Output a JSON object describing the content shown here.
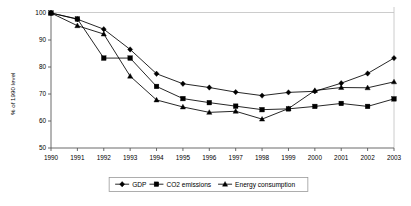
{
  "chart_data": {
    "type": "line",
    "title": "",
    "xlabel": "",
    "ylabel": "% of 1990 level",
    "categories": [
      "1990",
      "1991",
      "1992",
      "1993",
      "1994",
      "1995",
      "1996",
      "1997",
      "1998",
      "1999",
      "2000",
      "2001",
      "2002",
      "2003"
    ],
    "x": [
      1990,
      1991,
      1992,
      1993,
      1994,
      1995,
      1996,
      1997,
      1998,
      1999,
      2000,
      2001,
      2002,
      2003
    ],
    "ylim": [
      50,
      100
    ],
    "xlim": [
      1990,
      2003
    ],
    "yticks": [
      50,
      60,
      70,
      80,
      90,
      100
    ],
    "ytick_labels": [
      "50",
      "60",
      "70",
      "80",
      "90",
      "100"
    ],
    "grid": false,
    "legend_position": "bottom",
    "series": [
      {
        "name": "GDP",
        "marker": "diamond",
        "color": "#000000",
        "values": [
          100.0,
          97.7,
          94.0,
          86.5,
          77.5,
          73.8,
          72.4,
          70.7,
          69.4,
          70.6,
          71.0,
          74.0,
          77.6,
          83.3
        ]
      },
      {
        "name": "CO2 emissions",
        "marker": "square",
        "color": "#000000",
        "values": [
          100.0,
          97.8,
          83.3,
          83.3,
          72.8,
          68.3,
          66.8,
          65.5,
          64.2,
          64.5,
          65.4,
          66.5,
          65.4,
          68.2
        ]
      },
      {
        "name": "Energy consumption",
        "marker": "triangle",
        "color": "#000000",
        "values": [
          100.0,
          95.3,
          92.2,
          76.6,
          67.8,
          65.2,
          63.2,
          63.6,
          60.7,
          64.6,
          71.3,
          72.4,
          72.3,
          74.5
        ]
      }
    ]
  },
  "legend": {
    "items": [
      {
        "label": "GDP",
        "marker": "diamond"
      },
      {
        "label": "CO2 emissions",
        "marker": "square"
      },
      {
        "label": "Energy consumption",
        "marker": "triangle"
      }
    ]
  },
  "axes": {
    "y_title": "% of 1990 level"
  }
}
